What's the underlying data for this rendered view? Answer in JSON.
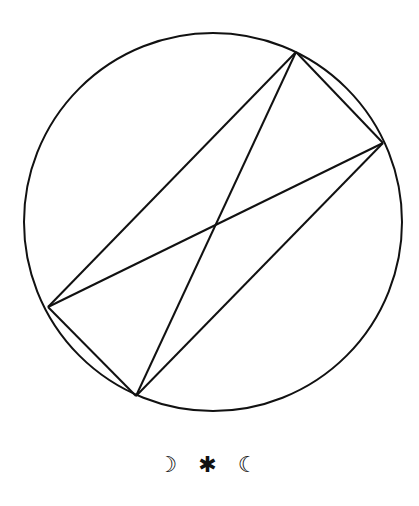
{
  "diagram": {
    "circle": {
      "cx": 213,
      "cy": 222,
      "r": 189,
      "stroke": "#111111",
      "stroke_width": 2
    },
    "vertices": {
      "A": [
        296,
        52
      ],
      "B": [
        383,
        143
      ],
      "C": [
        48,
        307
      ],
      "D": [
        136,
        396
      ]
    },
    "segments": [
      [
        "A",
        "B"
      ],
      [
        "A",
        "C"
      ],
      [
        "A",
        "D"
      ],
      [
        "B",
        "C"
      ],
      [
        "B",
        "D"
      ],
      [
        "C",
        "D"
      ]
    ]
  },
  "caption": {
    "symbols": [
      "☽",
      "✱",
      "☾"
    ]
  }
}
